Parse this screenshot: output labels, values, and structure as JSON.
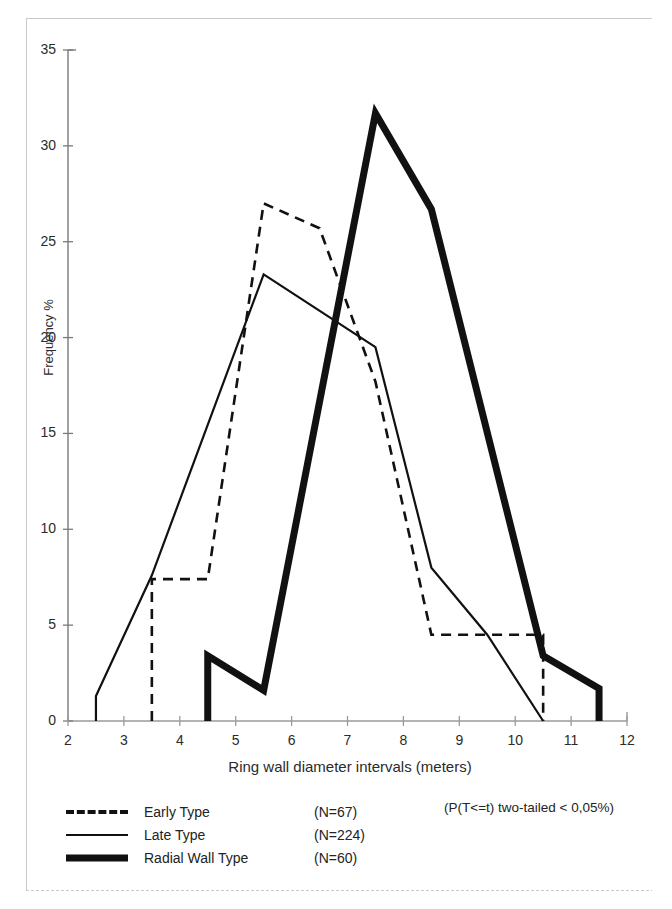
{
  "chart_data": {
    "type": "line",
    "title": "",
    "xlabel": "Ring wall diameter intervals (meters)",
    "ylabel": "Frequency %",
    "xlim": [
      2,
      12
    ],
    "ylim": [
      0,
      35
    ],
    "xticks": [
      2,
      3,
      4,
      5,
      6,
      7,
      8,
      9,
      10,
      11,
      12
    ],
    "yticks": [
      0,
      5,
      10,
      15,
      20,
      25,
      30,
      35
    ],
    "grid": false,
    "legend_position": "below-plot",
    "annotation": "(P(T<=t) two-tailed < 0,05%)",
    "series": [
      {
        "name": "Early Type",
        "count_label": "(N=67)",
        "style": "dashed",
        "swatch": "sw-dashed",
        "color": "#111111",
        "width": 2.6,
        "x": [
          3.5,
          3.5,
          4.5,
          5.5,
          6.5,
          7.5,
          8.5,
          10.5,
          10.5
        ],
        "y": [
          0,
          7.4,
          7.4,
          27.0,
          25.7,
          17.7,
          4.5,
          4.5,
          0
        ]
      },
      {
        "name": "Late Type",
        "count_label": "(N=224)",
        "style": "solid",
        "swatch": "sw-solid",
        "color": "#111111",
        "width": 2.2,
        "x": [
          2.5,
          2.5,
          3.5,
          5.5,
          7.5,
          8.5,
          9.5,
          10.5
        ],
        "y": [
          0,
          1.3,
          7.6,
          23.3,
          19.5,
          8.0,
          4.5,
          0
        ]
      },
      {
        "name": "Radial Wall Type",
        "count_label": "(N=60)",
        "style": "thick",
        "swatch": "sw-thick",
        "color": "#111111",
        "width": 7.0,
        "x": [
          4.5,
          4.5,
          5.5,
          7.5,
          8.5,
          10.5,
          11.5,
          11.5
        ],
        "y": [
          0,
          3.4,
          1.6,
          31.7,
          26.7,
          3.4,
          1.7,
          0
        ]
      }
    ]
  },
  "axes": {
    "y_tick_labels": [
      "35",
      "30",
      "25",
      "20",
      "15",
      "10",
      "5",
      "0"
    ],
    "x_tick_labels": [
      "2",
      "3",
      "4",
      "5",
      "6",
      "7",
      "8",
      "9",
      "10",
      "11",
      "12"
    ]
  }
}
